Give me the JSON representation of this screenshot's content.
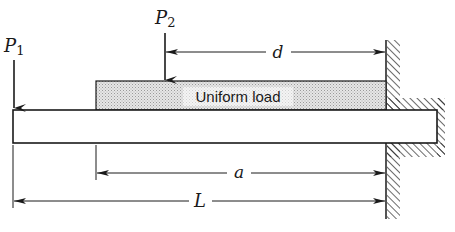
{
  "diagram": {
    "type": "cantilever-beam-loading",
    "loads": {
      "p1": {
        "symbol": "P",
        "subscript": "1"
      },
      "p2": {
        "symbol": "P",
        "subscript": "2"
      },
      "uniform": {
        "label": "Uniform load"
      }
    },
    "dimensions": {
      "d": {
        "label": "d"
      },
      "a": {
        "label": "a"
      },
      "L": {
        "label": "L"
      }
    },
    "colors": {
      "line": "#1a1a1a",
      "load_fill": "#d9d9d9",
      "beam_fill": "#ffffff",
      "background": "#ffffff"
    }
  }
}
